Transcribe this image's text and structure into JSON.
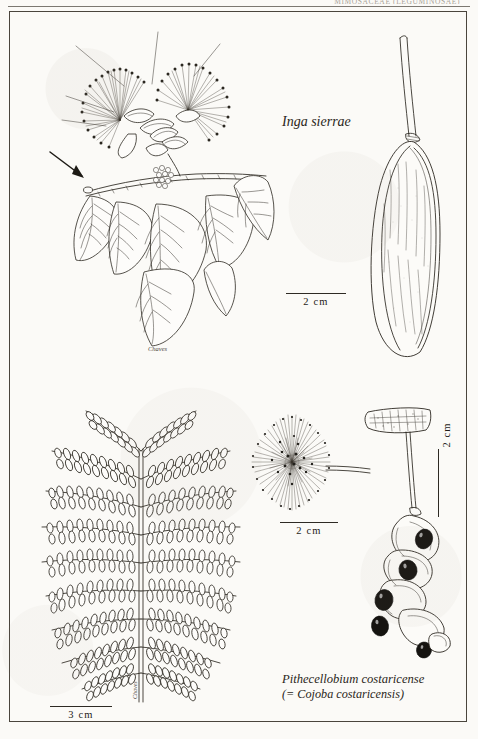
{
  "page": {
    "running_head": "MIMOSACEAE (LEGUMINOSAE)",
    "width": 478,
    "height": 739,
    "paper_color": "#fbfaf7",
    "ink_color": "#2b2720"
  },
  "plate": {
    "frame": "illustration-plate-border",
    "figures": [
      {
        "id": "inga-flowering-branch",
        "name": "Inga sierrae flowering branch with leaves",
        "position": "upper-left"
      },
      {
        "id": "inga-pod",
        "name": "Inga sierrae legume pod",
        "position": "upper-right"
      },
      {
        "id": "pithecellobium-leaf",
        "name": "Pithecellobium costaricense bipinnate leaf",
        "position": "lower-left"
      },
      {
        "id": "pithecellobium-flowerhead",
        "name": "Pithecellobium costaricense globose flower head",
        "position": "lower-middle"
      },
      {
        "id": "pithecellobium-pod",
        "name": "Pithecellobium costaricense twisted dehiscent pod with black seeds",
        "position": "lower-right"
      }
    ]
  },
  "labels": {
    "inga_species": "Inga sierrae",
    "pithecellobium_species": "Pithecellobium costaricense",
    "pithecellobium_synonym": "(= Cojoba costaricensis)"
  },
  "scale_bars": [
    {
      "id": "scale-inga-pod",
      "value": "2 cm",
      "orientation": "horizontal"
    },
    {
      "id": "scale-flowerhead",
      "value": "2 cm",
      "orientation": "horizontal"
    },
    {
      "id": "scale-pod-vertical",
      "value": "2 cm",
      "orientation": "vertical"
    },
    {
      "id": "scale-leaf",
      "value": "3 cm",
      "orientation": "horizontal"
    }
  ],
  "signatures": {
    "inga_artist": "Chaves",
    "leaf_artist": "Chaves"
  }
}
